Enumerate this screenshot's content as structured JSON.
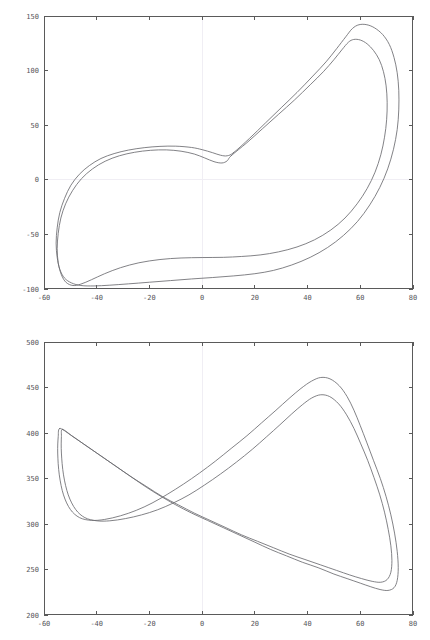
{
  "figure": {
    "header_text": "",
    "background": "#ffffff",
    "curve_color": "#6b6b70",
    "axis_color": "#5a5a5a",
    "grid_color": "#f0eef4"
  },
  "chart_data": [
    {
      "type": "line",
      "id": "phase-portrait-top",
      "title": "",
      "subtitle": "",
      "xlabel": "",
      "ylabel": "",
      "xlim": [
        -60,
        80
      ],
      "ylim": [
        -100,
        150
      ],
      "xticks": [
        -60,
        -40,
        -20,
        0,
        20,
        40,
        60,
        80
      ],
      "yticks": [
        -100,
        -50,
        0,
        50,
        100,
        150
      ],
      "xtick_labels": [
        "-60",
        "-40",
        "-20",
        "0",
        "20",
        "40",
        "60",
        "80"
      ],
      "ytick_labels": [
        "-100",
        "-50",
        "0",
        "50",
        "100",
        "150"
      ],
      "grid": true,
      "grid_axes": [
        "x=0",
        "y=0"
      ],
      "legend": null,
      "series": [
        {
          "name": "outer-orbit",
          "closed": true,
          "points": [
            [
              12.0,
              25.0
            ],
            [
              18.0,
              38.0
            ],
            [
              24.0,
              52.0
            ],
            [
              30.0,
              66.0
            ],
            [
              36.0,
              80.0
            ],
            [
              42.0,
              95.0
            ],
            [
              47.0,
              108.0
            ],
            [
              51.0,
              120.0
            ],
            [
              54.5,
              131.0
            ],
            [
              57.0,
              138.5
            ],
            [
              59.5,
              142.0
            ],
            [
              62.5,
              142.0
            ],
            [
              65.5,
              139.0
            ],
            [
              68.5,
              133.0
            ],
            [
              71.0,
              124.0
            ],
            [
              72.8,
              112.0
            ],
            [
              74.0,
              98.0
            ],
            [
              74.6,
              82.0
            ],
            [
              74.6,
              64.0
            ],
            [
              74.0,
              46.0
            ],
            [
              72.6,
              28.0
            ],
            [
              70.4,
              10.0
            ],
            [
              67.4,
              -7.0
            ],
            [
              63.6,
              -23.0
            ],
            [
              59.0,
              -38.0
            ],
            [
              53.6,
              -51.0
            ],
            [
              47.6,
              -62.0
            ],
            [
              41.0,
              -71.0
            ],
            [
              34.0,
              -78.0
            ],
            [
              27.0,
              -83.0
            ],
            [
              20.0,
              -86.0
            ],
            [
              12.0,
              -88.0
            ],
            [
              4.0,
              -89.5
            ],
            [
              -4.0,
              -90.8
            ],
            [
              -12.0,
              -92.3
            ],
            [
              -20.0,
              -93.8
            ],
            [
              -28.0,
              -95.3
            ],
            [
              -35.0,
              -96.5
            ],
            [
              -41.0,
              -97.2
            ],
            [
              -46.0,
              -96.8
            ],
            [
              -49.5,
              -94.5
            ],
            [
              -52.2,
              -90.0
            ],
            [
              -54.0,
              -82.0
            ],
            [
              -55.0,
              -71.0
            ],
            [
              -55.4,
              -58.0
            ],
            [
              -55.0,
              -44.0
            ],
            [
              -54.0,
              -30.0
            ],
            [
              -52.2,
              -17.0
            ],
            [
              -49.8,
              -5.0
            ],
            [
              -46.6,
              5.0
            ],
            [
              -42.8,
              13.0
            ],
            [
              -38.4,
              19.5
            ],
            [
              -33.4,
              24.0
            ],
            [
              -28.0,
              27.2
            ],
            [
              -22.0,
              29.4
            ],
            [
              -16.0,
              30.6
            ],
            [
              -10.0,
              30.8
            ],
            [
              -4.0,
              29.6
            ],
            [
              0.0,
              27.6
            ],
            [
              4.0,
              24.8
            ],
            [
              7.0,
              22.5
            ],
            [
              9.5,
              22.0
            ],
            [
              12.0,
              25.0
            ]
          ]
        },
        {
          "name": "inner-orbit",
          "closed": true,
          "points": [
            [
              11.0,
              22.0
            ],
            [
              17.0,
              34.0
            ],
            [
              23.0,
              47.0
            ],
            [
              29.0,
              60.0
            ],
            [
              35.0,
              73.0
            ],
            [
              41.0,
              87.0
            ],
            [
              46.0,
              99.0
            ],
            [
              50.0,
              110.0
            ],
            [
              53.0,
              119.0
            ],
            [
              55.5,
              126.0
            ],
            [
              57.5,
              128.5
            ],
            [
              60.0,
              128.0
            ],
            [
              62.6,
              124.5
            ],
            [
              65.0,
              118.5
            ],
            [
              67.2,
              110.0
            ],
            [
              68.8,
              99.0
            ],
            [
              69.8,
              86.0
            ],
            [
              70.2,
              71.0
            ],
            [
              70.0,
              55.0
            ],
            [
              69.2,
              39.0
            ],
            [
              67.8,
              23.0
            ],
            [
              65.6,
              7.0
            ],
            [
              62.6,
              -8.0
            ],
            [
              58.8,
              -22.0
            ],
            [
              54.2,
              -35.0
            ],
            [
              48.8,
              -46.0
            ],
            [
              42.6,
              -55.0
            ],
            [
              36.0,
              -61.5
            ],
            [
              29.0,
              -66.0
            ],
            [
              22.0,
              -68.8
            ],
            [
              15.0,
              -70.2
            ],
            [
              8.0,
              -71.0
            ],
            [
              0.0,
              -71.2
            ],
            [
              -8.0,
              -71.6
            ],
            [
              -16.0,
              -73.0
            ],
            [
              -24.0,
              -76.0
            ],
            [
              -31.0,
              -80.5
            ],
            [
              -37.0,
              -86.0
            ],
            [
              -42.0,
              -91.5
            ],
            [
              -46.0,
              -95.5
            ],
            [
              -49.0,
              -96.8
            ],
            [
              -51.6,
              -94.0
            ],
            [
              -53.4,
              -87.0
            ],
            [
              -54.6,
              -76.0
            ],
            [
              -55.0,
              -63.0
            ],
            [
              -54.6,
              -49.0
            ],
            [
              -53.6,
              -35.0
            ],
            [
              -51.8,
              -22.0
            ],
            [
              -49.2,
              -10.0
            ],
            [
              -45.8,
              1.0
            ],
            [
              -41.6,
              10.0
            ],
            [
              -36.8,
              17.0
            ],
            [
              -31.4,
              22.0
            ],
            [
              -25.6,
              25.2
            ],
            [
              -19.6,
              27.0
            ],
            [
              -13.6,
              27.4
            ],
            [
              -8.0,
              26.2
            ],
            [
              -3.0,
              23.6
            ],
            [
              1.0,
              20.0
            ],
            [
              4.5,
              16.6
            ],
            [
              7.5,
              15.4
            ],
            [
              9.5,
              17.4
            ],
            [
              11.0,
              22.0
            ]
          ]
        }
      ]
    },
    {
      "type": "line",
      "id": "phase-portrait-bottom",
      "title": "",
      "subtitle": "",
      "xlabel": "",
      "ylabel": "",
      "xlim": [
        -60,
        80
      ],
      "ylim": [
        200,
        500
      ],
      "xticks": [
        -60,
        -40,
        -20,
        0,
        20,
        40,
        60,
        80
      ],
      "yticks": [
        200,
        250,
        300,
        350,
        400,
        450,
        500
      ],
      "xtick_labels": [
        "-60",
        "-40",
        "-20",
        "0",
        "20",
        "40",
        "60",
        "80"
      ],
      "ytick_labels": [
        "200",
        "250",
        "300",
        "350",
        "400",
        "450",
        "500"
      ],
      "grid": true,
      "grid_axes": [
        "x=0"
      ],
      "legend": null,
      "series": [
        {
          "name": "outer-orbit",
          "closed": true,
          "points": [
            [
              -54.0,
              405.0
            ],
            [
              -50.0,
              398.0
            ],
            [
              -45.0,
              388.0
            ],
            [
              -40.0,
              378.0
            ],
            [
              -34.0,
              366.0
            ],
            [
              -28.0,
              354.0
            ],
            [
              -22.0,
              342.0
            ],
            [
              -16.0,
              331.0
            ],
            [
              -10.0,
              321.0
            ],
            [
              -4.0,
              312.0
            ],
            [
              2.0,
              304.0
            ],
            [
              8.0,
              296.0
            ],
            [
              14.0,
              288.0
            ],
            [
              20.0,
              280.0
            ],
            [
              26.0,
              272.0
            ],
            [
              32.0,
              265.0
            ],
            [
              38.0,
              258.0
            ],
            [
              44.0,
              252.0
            ],
            [
              50.0,
              245.0
            ],
            [
              55.0,
              240.0
            ],
            [
              60.0,
              235.0
            ],
            [
              64.0,
              231.0
            ],
            [
              67.5,
              228.0
            ],
            [
              70.5,
              227.0
            ],
            [
              72.8,
              230.0
            ],
            [
              74.0,
              238.0
            ],
            [
              74.4,
              252.0
            ],
            [
              74.0,
              270.0
            ],
            [
              73.0,
              290.0
            ],
            [
              71.6,
              310.0
            ],
            [
              69.8,
              330.0
            ],
            [
              67.6,
              350.0
            ],
            [
              65.0,
              370.0
            ],
            [
              62.4,
              390.0
            ],
            [
              60.0,
              408.0
            ],
            [
              57.6,
              425.0
            ],
            [
              55.0,
              440.0
            ],
            [
              52.0,
              452.0
            ],
            [
              48.5,
              459.5
            ],
            [
              45.0,
              461.0
            ],
            [
              41.5,
              457.0
            ],
            [
              37.5,
              449.0
            ],
            [
              33.0,
              438.0
            ],
            [
              28.0,
              425.0
            ],
            [
              22.5,
              411.0
            ],
            [
              17.0,
              397.0
            ],
            [
              11.0,
              383.0
            ],
            [
              5.0,
              369.0
            ],
            [
              -1.0,
              356.0
            ],
            [
              -7.0,
              344.0
            ],
            [
              -13.0,
              333.0
            ],
            [
              -19.0,
              323.0
            ],
            [
              -25.0,
              315.0
            ],
            [
              -31.0,
              309.0
            ],
            [
              -37.0,
              305.0
            ],
            [
              -42.0,
              304.0
            ],
            [
              -46.5,
              307.0
            ],
            [
              -50.0,
              316.0
            ],
            [
              -52.6,
              332.0
            ],
            [
              -54.2,
              354.0
            ],
            [
              -54.8,
              378.0
            ],
            [
              -54.6,
              396.0
            ],
            [
              -54.0,
              405.0
            ]
          ]
        },
        {
          "name": "inner-orbit",
          "closed": true,
          "points": [
            [
              -53.0,
              404.0
            ],
            [
              -49.0,
              396.0
            ],
            [
              -44.0,
              386.0
            ],
            [
              -39.0,
              376.0
            ],
            [
              -33.0,
              364.0
            ],
            [
              -27.0,
              352.0
            ],
            [
              -21.0,
              341.0
            ],
            [
              -15.0,
              330.0
            ],
            [
              -9.0,
              321.0
            ],
            [
              -3.0,
              312.0
            ],
            [
              3.0,
              304.0
            ],
            [
              9.0,
              296.0
            ],
            [
              15.0,
              288.0
            ],
            [
              21.0,
              281.0
            ],
            [
              27.0,
              274.0
            ],
            [
              33.0,
              267.0
            ],
            [
              39.0,
              261.0
            ],
            [
              45.0,
              255.0
            ],
            [
              51.0,
              249.0
            ],
            [
              56.0,
              244.0
            ],
            [
              60.5,
              240.0
            ],
            [
              64.5,
              237.0
            ],
            [
              67.8,
              236.0
            ],
            [
              70.2,
              239.0
            ],
            [
              71.6,
              247.0
            ],
            [
              72.0,
              260.0
            ],
            [
              71.6,
              276.0
            ],
            [
              70.6,
              294.0
            ],
            [
              69.2,
              313.0
            ],
            [
              67.4,
              332.0
            ],
            [
              65.2,
              351.0
            ],
            [
              62.8,
              370.0
            ],
            [
              60.2,
              388.0
            ],
            [
              57.6,
              405.0
            ],
            [
              54.8,
              420.0
            ],
            [
              51.8,
              432.0
            ],
            [
              48.4,
              440.0
            ],
            [
              45.0,
              442.0
            ],
            [
              41.6,
              438.5
            ],
            [
              38.0,
              431.0
            ],
            [
              34.0,
              421.0
            ],
            [
              29.5,
              409.0
            ],
            [
              24.5,
              396.0
            ],
            [
              19.0,
              382.0
            ],
            [
              13.0,
              368.0
            ],
            [
              7.0,
              355.0
            ],
            [
              1.0,
              343.0
            ],
            [
              -5.0,
              332.0
            ],
            [
              -11.0,
              323.0
            ],
            [
              -17.0,
              315.5
            ],
            [
              -23.0,
              310.0
            ],
            [
              -29.0,
              306.0
            ],
            [
              -35.0,
              303.5
            ],
            [
              -40.0,
              303.5
            ],
            [
              -44.5,
              307.0
            ],
            [
              -48.0,
              316.0
            ],
            [
              -50.8,
              332.0
            ],
            [
              -52.6,
              354.0
            ],
            [
              -53.4,
              378.0
            ],
            [
              -53.4,
              396.0
            ],
            [
              -53.0,
              404.0
            ]
          ]
        }
      ]
    }
  ]
}
